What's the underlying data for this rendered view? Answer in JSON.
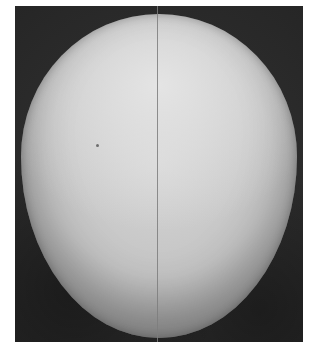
{
  "image": {
    "subject": "egg",
    "description": "Grayscale photograph of an egg on a dark background with a thin vertical line through its center",
    "colors": {
      "background": "#2b2b2b",
      "egg_highlight": "#e4e4e4",
      "egg_mid": "#c4c4c4",
      "egg_shadow": "#8c8c8c",
      "center_line": "#7d7d7d",
      "border": "#ffffff"
    }
  }
}
